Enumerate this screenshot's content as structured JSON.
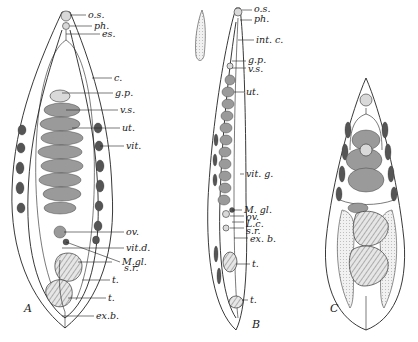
{
  "figures": {
    "A": {
      "letter": "A",
      "labels": [
        "o.s.",
        "ph.",
        "es.",
        "c.",
        "g.p.",
        "v.s.",
        "ut.",
        "vit.",
        "ov.",
        "vit.d.",
        "M.gl.",
        "s.r.",
        "t.",
        "t.",
        "ex.b."
      ]
    },
    "B": {
      "letter": "B",
      "labels": [
        "o.s.",
        "ph.",
        "int. c.",
        "g.p.",
        "v.s.",
        "ut.",
        "vit. g.",
        "M. gl.",
        "ov.",
        "L.c.",
        "s.r.",
        "ex. b.",
        "t.",
        "t."
      ]
    },
    "C": {
      "letter": "C",
      "labels": []
    }
  },
  "colors": {
    "ink": "#222222",
    "paper": "#ffffff"
  }
}
